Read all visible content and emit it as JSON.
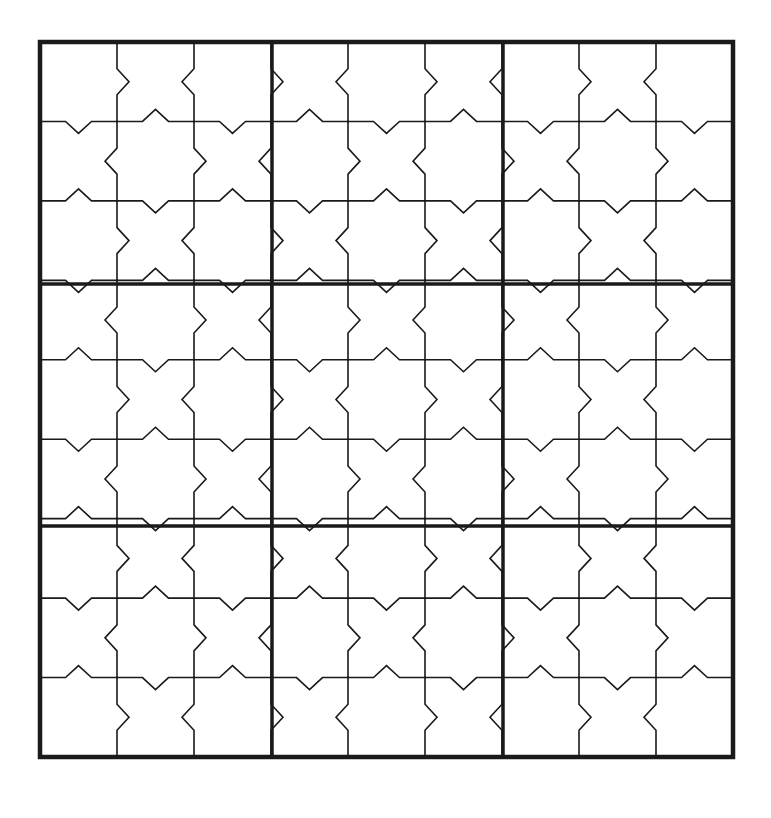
{
  "figure": {
    "name": "star-tessellation-grid",
    "title": "Nine-block star tessellation grid",
    "canvas": {
      "width": 771,
      "height": 818,
      "background_color": "#ffffff"
    }
  },
  "geometry": {
    "grid_origin_x": 40,
    "grid_origin_y": 42,
    "grid_width": 693,
    "grid_height": 715,
    "blocks_across": 3,
    "blocks_down": 3,
    "cells_per_block_across": 3,
    "cells_per_block_down": 3,
    "total_cells_across": 9,
    "total_cells_down": 9,
    "cell_width": 77,
    "cell_height": 79.444,
    "chevron_amplitude": 12,
    "chevron_half_span": 13
  },
  "style": {
    "line_color": "#1a1a1a",
    "fill_color": "#ffffff",
    "outer_border_width": 4.5,
    "block_divider_width": 3.5,
    "cell_line_width": 1.6
  },
  "block_dividers": {
    "vertical_x": [
      272,
      503
    ],
    "horizontal_y": [
      284,
      526
    ]
  },
  "cell_lines": {
    "vertical_x": [
      117,
      194,
      349,
      426,
      580,
      657
    ],
    "horizontal_y": [
      121,
      200,
      363,
      442,
      605,
      684
    ]
  },
  "motifs": {
    "star_label": "eight-pointed-star",
    "cross_label": "four-armed-cross",
    "star_count": 20,
    "cross_count": 16,
    "parity_rule": "cells where (row + column) is even render as eight-pointed stars; cells where (row + column) is odd render as crosses"
  },
  "legend": {
    "shown": false,
    "entries": []
  },
  "annotations": {
    "shown": false,
    "items": []
  }
}
